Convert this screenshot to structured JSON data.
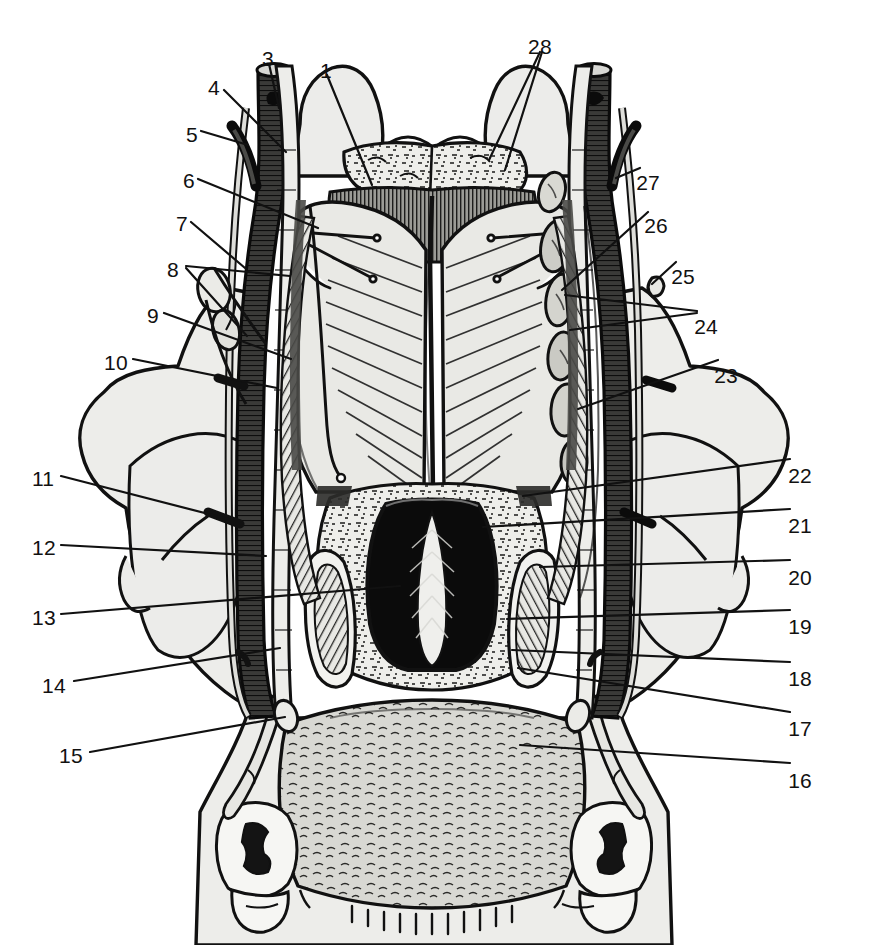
{
  "figure": {
    "view": "posterior (dorsal) dissection of the neck",
    "style": "black-and-white engraved line drawing with hatched shading",
    "label_count": 28,
    "ink_color": "#111111",
    "paper_color": "#ffffff",
    "fill_light": "#ebebe8",
    "fill_mid": "#b9b9b4",
    "fill_dark": "#6f6f6c",
    "fill_vessel": "#3a3a38"
  },
  "labels": [
    {
      "id": "1",
      "text": "1",
      "x": 320,
      "y": 60,
      "align": "left",
      "leaders": [
        [
          [
            327,
            75
          ],
          [
            372,
            185
          ]
        ]
      ]
    },
    {
      "id": "3",
      "text": "3",
      "x": 262,
      "y": 48,
      "align": "left",
      "leaders": [
        [
          [
            269,
            64
          ],
          [
            279,
            108
          ]
        ]
      ]
    },
    {
      "id": "4",
      "text": "4",
      "x": 208,
      "y": 77,
      "align": "left",
      "leaders": [
        [
          [
            224,
            90
          ],
          [
            286,
            152
          ]
        ]
      ]
    },
    {
      "id": "5",
      "text": "5",
      "x": 186,
      "y": 124,
      "align": "left",
      "leaders": [
        [
          [
            201,
            131
          ],
          [
            248,
            145
          ]
        ]
      ]
    },
    {
      "id": "6",
      "text": "6",
      "x": 183,
      "y": 170,
      "align": "left",
      "leaders": [
        [
          [
            198,
            179
          ],
          [
            318,
            228
          ]
        ]
      ]
    },
    {
      "id": "7",
      "text": "7",
      "x": 176,
      "y": 213,
      "align": "left",
      "leaders": [
        [
          [
            191,
            222
          ],
          [
            245,
            268
          ]
        ]
      ]
    },
    {
      "id": "8",
      "text": "8",
      "x": 167,
      "y": 259,
      "align": "left",
      "leaders": [
        [
          [
            186,
            266
          ],
          [
            290,
            276
          ]
        ],
        [
          [
            186,
            268
          ],
          [
            247,
            336
          ]
        ]
      ]
    },
    {
      "id": "9",
      "text": "9",
      "x": 147,
      "y": 305,
      "align": "left",
      "leaders": [
        [
          [
            164,
            313
          ],
          [
            291,
            359
          ]
        ]
      ]
    },
    {
      "id": "10",
      "text": "10",
      "x": 104,
      "y": 352,
      "align": "left",
      "leaders": [
        [
          [
            133,
            359
          ],
          [
            277,
            388
          ]
        ]
      ]
    },
    {
      "id": "11",
      "text": "11",
      "x": 32,
      "y": 468,
      "align": "left",
      "leaders": [
        [
          [
            61,
            476
          ],
          [
            228,
            519
          ]
        ]
      ]
    },
    {
      "id": "12",
      "text": "12",
      "x": 32,
      "y": 537,
      "align": "left",
      "leaders": [
        [
          [
            61,
            545
          ],
          [
            266,
            556
          ]
        ]
      ]
    },
    {
      "id": "13",
      "text": "13",
      "x": 32,
      "y": 607,
      "align": "left",
      "leaders": [
        [
          [
            61,
            614
          ],
          [
            400,
            586
          ]
        ]
      ]
    },
    {
      "id": "14",
      "text": "14",
      "x": 42,
      "y": 675,
      "align": "left",
      "leaders": [
        [
          [
            74,
            681
          ],
          [
            280,
            648
          ]
        ]
      ]
    },
    {
      "id": "15",
      "text": "15",
      "x": 59,
      "y": 745,
      "align": "left",
      "leaders": [
        [
          [
            90,
            752
          ],
          [
            285,
            717
          ]
        ]
      ]
    },
    {
      "id": "16",
      "text": "16",
      "x": 812,
      "y": 770,
      "align": "right",
      "leaders": [
        [
          [
            790,
            763
          ],
          [
            520,
            745
          ]
        ]
      ]
    },
    {
      "id": "17",
      "text": "17",
      "x": 812,
      "y": 718,
      "align": "right",
      "leaders": [
        [
          [
            790,
            712
          ],
          [
            518,
            668
          ]
        ]
      ]
    },
    {
      "id": "18",
      "text": "18",
      "x": 812,
      "y": 668,
      "align": "right",
      "leaders": [
        [
          [
            790,
            662
          ],
          [
            512,
            650
          ]
        ]
      ]
    },
    {
      "id": "19",
      "text": "19",
      "x": 812,
      "y": 616,
      "align": "right",
      "leaders": [
        [
          [
            790,
            610
          ],
          [
            507,
            619
          ]
        ]
      ]
    },
    {
      "id": "20",
      "text": "20",
      "x": 812,
      "y": 567,
      "align": "right",
      "leaders": [
        [
          [
            790,
            560
          ],
          [
            540,
            567
          ]
        ]
      ]
    },
    {
      "id": "21",
      "text": "21",
      "x": 812,
      "y": 515,
      "align": "right",
      "leaders": [
        [
          [
            790,
            509
          ],
          [
            483,
            527
          ]
        ]
      ]
    },
    {
      "id": "22",
      "text": "22",
      "x": 812,
      "y": 465,
      "align": "right",
      "leaders": [
        [
          [
            790,
            459
          ],
          [
            523,
            496
          ]
        ]
      ]
    },
    {
      "id": "23",
      "text": "23",
      "x": 738,
      "y": 365,
      "align": "right",
      "leaders": [
        [
          [
            718,
            360
          ],
          [
            578,
            409
          ]
        ]
      ]
    },
    {
      "id": "24",
      "text": "24",
      "x": 718,
      "y": 316,
      "align": "right",
      "leaders": [
        [
          [
            697,
            311
          ],
          [
            565,
            295
          ]
        ],
        [
          [
            697,
            313
          ],
          [
            570,
            330
          ]
        ]
      ]
    },
    {
      "id": "25",
      "text": "25",
      "x": 695,
      "y": 266,
      "align": "right",
      "leaders": [
        [
          [
            676,
            262
          ],
          [
            652,
            284
          ]
        ]
      ]
    },
    {
      "id": "26",
      "text": "26",
      "x": 668,
      "y": 215,
      "align": "right",
      "leaders": [
        [
          [
            648,
            212
          ],
          [
            562,
            290
          ]
        ]
      ]
    },
    {
      "id": "27",
      "text": "27",
      "x": 660,
      "y": 172,
      "align": "right",
      "leaders": [
        [
          [
            640,
            168
          ],
          [
            616,
            178
          ]
        ]
      ]
    },
    {
      "id": "28",
      "text": "28",
      "x": 528,
      "y": 36,
      "align": "left",
      "leaders": [
        [
          [
            540,
            52
          ],
          [
            489,
            160
          ]
        ],
        [
          [
            542,
            52
          ],
          [
            505,
            170
          ]
        ]
      ]
    }
  ]
}
